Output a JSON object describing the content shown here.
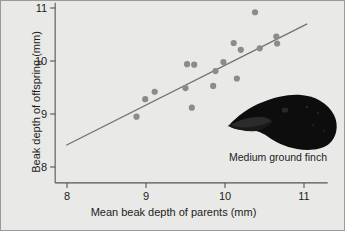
{
  "figure": {
    "background_color": "#e9e9e7",
    "border_color": "#9a9a98"
  },
  "annotations": {
    "finch_caption": "Medium ground finch",
    "finch_icon_name": "medium-ground-finch-silhouette"
  },
  "chart_data": {
    "type": "scatter",
    "title": "",
    "xlabel": "Mean beak depth of parents (mm)",
    "ylabel": "Beak depth of offspring (mm)",
    "xlim": [
      7.85,
      11.3
    ],
    "ylim": [
      7.7,
      11.1
    ],
    "xticks": [
      8,
      9,
      10,
      11
    ],
    "yticks": [
      8,
      9,
      10,
      11
    ],
    "xtick_labels": [
      "8",
      "9",
      "10",
      "11"
    ],
    "ytick_labels": [
      "8",
      "9",
      "10",
      "11"
    ],
    "grid": false,
    "legend": false,
    "point_color": "#8b8b89",
    "point_radius": 3.1,
    "line_color": "#6f6f6d",
    "axis_color": "#55555a",
    "series": [
      {
        "name": "Parent-offspring beak depth",
        "points": [
          [
            8.88,
            8.95
          ],
          [
            8.99,
            9.28
          ],
          [
            9.11,
            9.42
          ],
          [
            9.5,
            9.49
          ],
          [
            9.52,
            9.94
          ],
          [
            9.61,
            9.93
          ],
          [
            9.58,
            9.12
          ],
          [
            9.85,
            9.53
          ],
          [
            9.88,
            9.81
          ],
          [
            9.98,
            9.98
          ],
          [
            10.11,
            10.34
          ],
          [
            10.15,
            9.67
          ],
          [
            10.2,
            10.21
          ],
          [
            10.38,
            10.92
          ],
          [
            10.44,
            10.24
          ],
          [
            10.65,
            10.46
          ],
          [
            10.66,
            10.33
          ]
        ]
      }
    ],
    "trendline": {
      "name": "regression-line",
      "x_start": 7.99,
      "y_start": 8.41,
      "x_end": 11.04,
      "y_end": 10.7
    }
  }
}
